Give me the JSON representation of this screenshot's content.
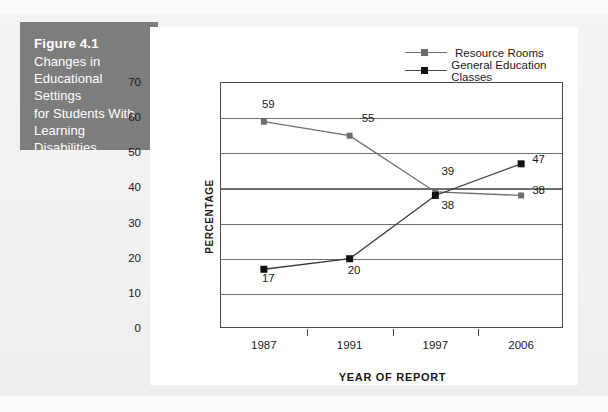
{
  "caption": {
    "figure_number": "Figure 4.1",
    "title": "Changes in Educational Settings for Students With Learning Disabilities",
    "line1": "Changes in",
    "line2": "Educational Settings",
    "line3": "for Students With",
    "line4": "Learning Disabilities",
    "box_color": "#7d7d7d",
    "text_color": "#ffffff"
  },
  "chart_data": {
    "type": "line",
    "title": "",
    "subtitle": "",
    "xlabel": "YEAR OF REPORT",
    "ylabel": "PERCENTAGE",
    "categories": [
      "1987",
      "1991",
      "1997",
      "2006"
    ],
    "ylim": [
      0,
      70
    ],
    "yticks": [
      0,
      10,
      20,
      30,
      40,
      50,
      60,
      70
    ],
    "ytick_labels": [
      "0",
      "10",
      "20",
      "30",
      "40",
      "50",
      "60",
      "70"
    ],
    "grid": true,
    "grid_axis": "y",
    "legend_position": "top-right",
    "series": [
      {
        "name": "Resource Rooms",
        "color": "#6e6e6e",
        "marker": "square",
        "values": [
          59,
          55,
          39,
          38
        ],
        "point_labels": [
          "59",
          "55",
          "39",
          "38"
        ]
      },
      {
        "name": "General Education Classes",
        "color": "#111111",
        "marker": "square",
        "values": [
          17,
          20,
          38,
          47
        ],
        "point_labels": [
          "17",
          "20",
          "38",
          "47"
        ]
      }
    ]
  }
}
